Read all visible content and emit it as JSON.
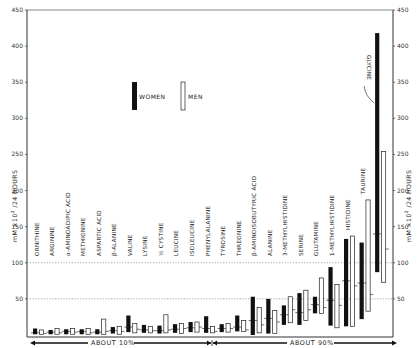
{
  "chart_data": {
    "type": "bar",
    "subtype": "floating-range-bars-with-mean",
    "title": "",
    "ylabel": "mM ×10^2 /24 HOURS",
    "ylabel_right": "mM ×10^2 /24 HOURS",
    "ylim": [
      0,
      450
    ],
    "yticks": [
      50,
      100,
      150,
      200,
      250,
      300,
      350,
      400,
      450
    ],
    "reference_lines": [
      50,
      100
    ],
    "legend": [
      {
        "name": "WOMEN",
        "fill": "#111111"
      },
      {
        "name": "MEN",
        "fill": "#ffffff"
      }
    ],
    "categories": [
      "ORNITHINE",
      "ARGININE",
      "α-AMINOADIPIC ACID",
      "METHIONINE",
      "ASPARTIC ACID",
      "β-ALANINE",
      "VALINE",
      "LYSINE",
      "½ CYSTINE",
      "LEUCINE",
      "ISOLEUCINE",
      "PHENYLALANINE",
      "TYROSINE",
      "THREONINE",
      "β-AMINOISOBUTYRIC ACID",
      "ALANINE",
      "3-METHYLHISTIDINE",
      "SERINE",
      "GLUTAMINE",
      "1-METHYLHISTIDINE",
      "HISTIDINE",
      "TAURINE",
      "GLYCINE"
    ],
    "series": [
      {
        "name": "WOMEN",
        "ranges": [
          [
            1,
            9
          ],
          [
            1,
            7
          ],
          [
            1,
            8
          ],
          [
            1,
            8
          ],
          [
            1,
            8
          ],
          [
            2,
            11
          ],
          [
            4,
            27
          ],
          [
            3,
            14
          ],
          [
            2,
            13
          ],
          [
            3,
            15
          ],
          [
            4,
            18
          ],
          [
            3,
            26
          ],
          [
            4,
            15
          ],
          [
            5,
            27
          ],
          [
            0,
            53
          ],
          [
            2,
            50
          ],
          [
            14,
            41
          ],
          [
            14,
            58
          ],
          [
            30,
            53
          ],
          [
            13,
            94
          ],
          [
            12,
            133
          ],
          [
            22,
            128
          ],
          [
            87,
            418
          ]
        ],
        "means": [
          3,
          4,
          5,
          5,
          4,
          6,
          11,
          7,
          6,
          8,
          10,
          9,
          9,
          11,
          20,
          23,
          28,
          31,
          42,
          48,
          75,
          72,
          140
        ]
      },
      {
        "name": "MEN",
        "ranges": [
          [
            1,
            7
          ],
          [
            1,
            9
          ],
          [
            1,
            9
          ],
          [
            1,
            9
          ],
          [
            1,
            22
          ],
          [
            1,
            12
          ],
          [
            3,
            16
          ],
          [
            3,
            12
          ],
          [
            3,
            28
          ],
          [
            2,
            16
          ],
          [
            4,
            18
          ],
          [
            3,
            12
          ],
          [
            4,
            16
          ],
          [
            5,
            20
          ],
          [
            3,
            38
          ],
          [
            2,
            34
          ],
          [
            17,
            53
          ],
          [
            20,
            62
          ],
          [
            30,
            79
          ],
          [
            10,
            70
          ],
          [
            12,
            137
          ],
          [
            33,
            187
          ],
          [
            73,
            254
          ]
        ],
        "means": [
          2,
          3,
          4,
          3,
          5,
          5,
          8,
          6,
          7,
          9,
          11,
          5,
          9,
          7,
          14,
          18,
          35,
          35,
          38,
          41,
          68,
          56,
          119
        ]
      }
    ],
    "group_annotations": [
      {
        "label": "ABOUT 10%",
        "from": "ORNITHINE",
        "to": "TYROSINE"
      },
      {
        "label": "ABOUT 90%",
        "from": "THREONINE",
        "to": "GLYCINE"
      }
    ],
    "annotations": [
      {
        "text": "GLYCINE",
        "points_to": "GLYCINE women bar"
      }
    ],
    "grid": false,
    "legend_position": "upper-center"
  },
  "text": {
    "ylabel_left": "mM ×10",
    "ylabel_sup": "2",
    "ylabel_tail": "/24 HOURS",
    "legend_women": "WOMEN",
    "legend_men": "MEN",
    "group_low": "ABOUT 10%",
    "group_high": "ABOUT 90%",
    "glycine_callout": "GLYCINE"
  }
}
